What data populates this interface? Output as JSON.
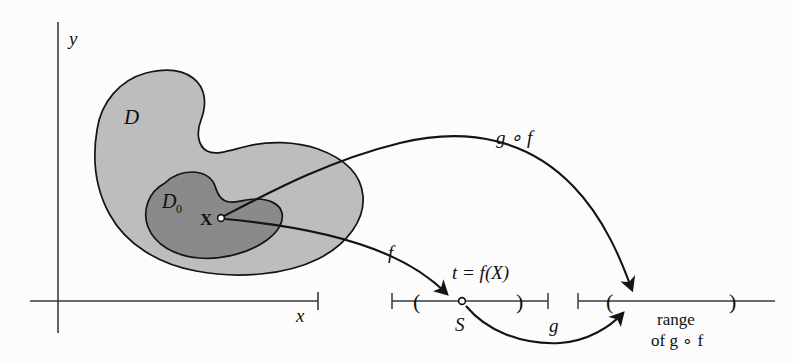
{
  "figure": {
    "background_color": "#fcfcfc",
    "stroke_color": "#141414"
  },
  "colors": {
    "region_outer_fill": "#bdbdbd",
    "region_inner_fill": "#8a8a8a",
    "axis": "#3a3a3a",
    "ink": "#141414"
  },
  "axes": {
    "y_label": "y",
    "x_label": "x"
  },
  "regions": {
    "outer_label": "D",
    "inner_label": "D",
    "inner_label_sub": "0"
  },
  "points": {
    "domain_point_label": "X",
    "image_point_label": "S"
  },
  "arrows": {
    "f_label": "f",
    "g_label": "g",
    "gof_label": "g ∘ f"
  },
  "annotations": {
    "t_equals": "t = f(X)",
    "range_line1": "range",
    "range_line2": "of g ∘ f"
  },
  "number_lines": {
    "s_line": {
      "open_paren": "(",
      "close_paren": ")"
    },
    "range_line": {
      "open_paren": "(",
      "close_paren": ")"
    }
  }
}
